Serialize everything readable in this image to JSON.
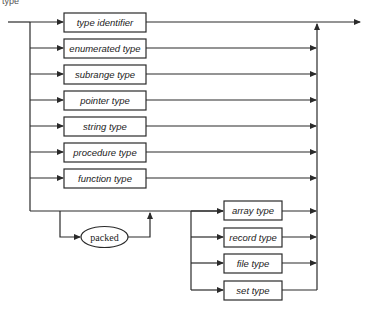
{
  "diagram": {
    "title_fragment": "type",
    "main_branch": [
      {
        "id": "type-identifier",
        "label": "type identifier"
      },
      {
        "id": "enumerated-type",
        "label": "enumerated type"
      },
      {
        "id": "subrange-type",
        "label": "subrange type"
      },
      {
        "id": "pointer-type",
        "label": "pointer type"
      },
      {
        "id": "string-type",
        "label": "string type"
      },
      {
        "id": "procedure-type",
        "label": "procedure type"
      },
      {
        "id": "function-type",
        "label": "function type"
      }
    ],
    "optional_keyword": {
      "label": "packed"
    },
    "structured_branch": [
      {
        "id": "array-type",
        "label": "array type"
      },
      {
        "id": "record-type",
        "label": "record type"
      },
      {
        "id": "file-type",
        "label": "file type"
      },
      {
        "id": "set-type",
        "label": "set type"
      }
    ],
    "colors": {
      "line": "#2a2a2a",
      "background": "#ffffff"
    }
  }
}
